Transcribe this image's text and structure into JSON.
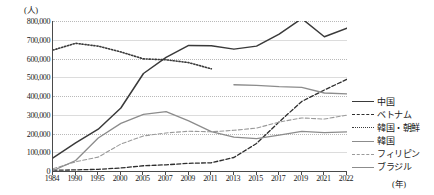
{
  "chart_data": {
    "type": "line",
    "title": "",
    "xlabel": "(年)",
    "ylabel": "(人)",
    "y_unit_label": "(人)",
    "x_unit_label": "(年)",
    "grid": true,
    "legend_position": "right",
    "xlim": [
      1984,
      2022
    ],
    "ylim": [
      0,
      800000
    ],
    "ytick_labels": [
      "800,000",
      "700,000",
      "600,000",
      "500,000",
      "400,000",
      "300,000",
      "200,000",
      "100,000",
      "0"
    ],
    "ytick_values": [
      800000,
      700000,
      600000,
      500000,
      400000,
      300000,
      200000,
      100000,
      0
    ],
    "categories": [
      "1984",
      "1990",
      "1995",
      "2000",
      "2005",
      "2007",
      "2009",
      "2011",
      "2013",
      "2015",
      "2017",
      "2019",
      "2021",
      "2022"
    ],
    "x": [
      1984,
      1990,
      1995,
      2000,
      2005,
      2007,
      2009,
      2011,
      2013,
      2015,
      2017,
      2019,
      2021,
      2022
    ],
    "series": [
      {
        "name": "中国",
        "style": "solid",
        "color": "#3a3a3a",
        "width": 1.5,
        "values": [
          70000,
          150000,
          223000,
          336000,
          520000,
          606000,
          670000,
          668000,
          650000,
          666000,
          730000,
          813000,
          716000,
          762000
        ]
      },
      {
        "name": "ベトナム",
        "style": "dashed",
        "color": "#2e2e2e",
        "width": 1.3,
        "values": [
          4000,
          6000,
          9000,
          16000,
          28000,
          33000,
          41000,
          44000,
          72000,
          147000,
          262000,
          371000,
          432000,
          489000
        ]
      },
      {
        "name": "韓国・朝鮮",
        "style": "dotted",
        "color": "#3a3a3a",
        "width": 1.6,
        "values": [
          645000,
          681000,
          666000,
          635000,
          598000,
          593000,
          578000,
          545000,
          null,
          null,
          null,
          null,
          null,
          null
        ]
      },
      {
        "name": "韓国",
        "style": "solid",
        "color": "#8c8c8c",
        "width": 1.3,
        "values": [
          null,
          null,
          null,
          null,
          null,
          null,
          null,
          null,
          460000,
          457000,
          450000,
          446000,
          416000,
          411000
        ]
      },
      {
        "name": "フィリピン",
        "style": "dashed",
        "color": "#9a9a9a",
        "width": 1.1,
        "values": [
          12000,
          49000,
          74000,
          144000,
          187000,
          203000,
          212000,
          209000,
          217000,
          229000,
          261000,
          283000,
          277000,
          298000
        ]
      },
      {
        "name": "ブラジル",
        "style": "solid",
        "color": "#8c8c8c",
        "width": 1.3,
        "values": [
          2000,
          56000,
          176000,
          254000,
          302000,
          317000,
          267000,
          210000,
          181000,
          173000,
          191000,
          211000,
          205000,
          209000
        ]
      }
    ]
  },
  "legend": {
    "items": [
      {
        "label": "中国",
        "style": "solid",
        "color": "#3a3a3a"
      },
      {
        "label": "ベトナム",
        "style": "dashed",
        "color": "#2e2e2e"
      },
      {
        "label": "韓国・朝鮮",
        "style": "dotted",
        "color": "#3a3a3a"
      },
      {
        "label": "韓国",
        "style": "solid",
        "color": "#8c8c8c"
      },
      {
        "label": "フィリピン",
        "style": "dashed",
        "color": "#9a9a9a"
      },
      {
        "label": "ブラジル",
        "style": "solid",
        "color": "#8c8c8c"
      }
    ]
  }
}
